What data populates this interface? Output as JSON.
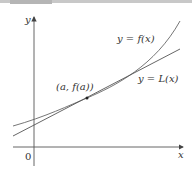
{
  "figure": {
    "type": "diagram",
    "axes": {
      "x_label": "x",
      "y_label": "y",
      "origin_label": "0"
    },
    "labels": {
      "curve": "y = f(x)",
      "tangent": "y = L(x)",
      "point": "(a, f(a))"
    },
    "colors": {
      "curve": "#555555",
      "tangent": "#555555",
      "axes": "#444444",
      "point": "#222222"
    }
  }
}
